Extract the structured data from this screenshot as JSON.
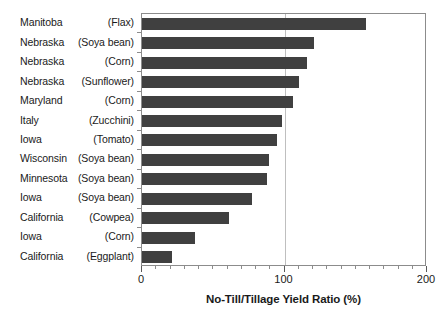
{
  "chart_data": {
    "type": "bar",
    "orientation": "horizontal",
    "title": "",
    "xlabel": "No-Till/Tillage Yield Ratio (%)",
    "ylabel": "",
    "xlim": [
      0,
      200
    ],
    "xticks": [
      0,
      100,
      200
    ],
    "xtick_labels": [
      "0",
      "100",
      "200"
    ],
    "minor_tick_step": 10,
    "grid": "vertical gridline at 100 only",
    "legend": "none",
    "bar_color": "#404040",
    "categories": [
      "Manitoba (Flax)",
      "Nebraska (Soya bean)",
      "Nebraska (Corn)",
      "Nebraska (Sunflower)",
      "Maryland (Corn)",
      "Italy (Zucchini)",
      "Iowa (Tomato)",
      "Wisconsin (Soya bean)",
      "Minnesota (Soya bean)",
      "Iowa (Soya bean)",
      "California (Cowpea)",
      "Iowa (Corn)",
      "California (Eggplant)"
    ],
    "values": [
      157,
      121,
      116,
      110,
      106,
      98,
      95,
      89,
      88,
      77,
      61,
      37,
      21
    ],
    "rows": [
      {
        "place": "Manitoba",
        "crop": "(Flax)",
        "value": 157
      },
      {
        "place": "Nebraska",
        "crop": "(Soya bean)",
        "value": 121
      },
      {
        "place": "Nebraska",
        "crop": "(Corn)",
        "value": 116
      },
      {
        "place": "Nebraska",
        "crop": "(Sunflower)",
        "value": 110
      },
      {
        "place": "Maryland",
        "crop": "(Corn)",
        "value": 106
      },
      {
        "place": "Italy",
        "crop": "(Zucchini)",
        "value": 98
      },
      {
        "place": "Iowa",
        "crop": "(Tomato)",
        "value": 95
      },
      {
        "place": "Wisconsin",
        "crop": "(Soya bean)",
        "value": 89
      },
      {
        "place": "Minnesota",
        "crop": "(Soya bean)",
        "value": 88
      },
      {
        "place": "Iowa",
        "crop": "(Soya bean)",
        "value": 77
      },
      {
        "place": "California",
        "crop": "(Cowpea)",
        "value": 61
      },
      {
        "place": "Iowa",
        "crop": "(Corn)",
        "value": 37
      },
      {
        "place": "California",
        "crop": "(Eggplant)",
        "value": 21
      }
    ]
  }
}
